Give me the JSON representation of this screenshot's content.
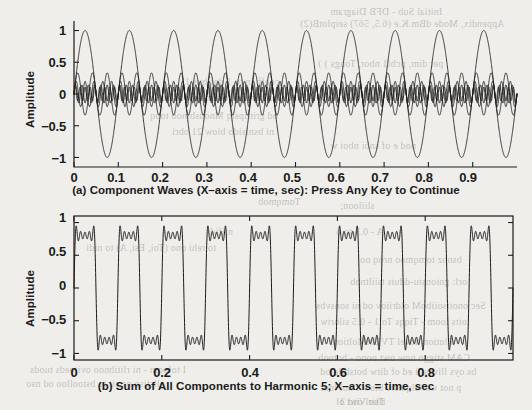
{
  "figure": {
    "background_color": "#efeeea",
    "line_color": "#1c1c1c",
    "panels": [
      {
        "id": "panel-a",
        "caption": "(a)  Component Waves (X–axis = time, sec): Press Any Key to Continue",
        "ylabel": "Amplitude",
        "yticks": [
          "1",
          "0.5",
          "0",
          "−0.5",
          "−1"
        ],
        "xticks": [
          "0",
          "0.1",
          "0.2",
          "0.3",
          "0.4",
          "0.5",
          "0.6",
          "0.7",
          "0.8",
          "0.9"
        ]
      },
      {
        "id": "panel-b",
        "caption": "(b)  Sum of All Components to Harmonic 5; X–axis = time, sec",
        "ylabel": "Amplitude",
        "yticks": [
          "1",
          "0.5",
          "0",
          "−0.5",
          "−1"
        ],
        "xticks": [
          "0",
          "0.2",
          "0.4",
          "0.6",
          "0.8"
        ]
      }
    ]
  },
  "chart_data": [
    {
      "type": "line",
      "id": "panel-a",
      "title": "(a)  Component Waves (X–axis = time, sec): Press Any Key to Continue",
      "xlabel": "time, sec",
      "ylabel": "Amplitude",
      "xlim": [
        0,
        1
      ],
      "ylim": [
        -1.15,
        1.15
      ],
      "xticks": [
        0,
        0.1,
        0.2,
        0.3,
        0.4,
        0.5,
        0.6,
        0.7,
        0.8,
        0.9
      ],
      "yticks": [
        -1,
        -0.5,
        0,
        0.5,
        1
      ],
      "grid": false,
      "legend": "none",
      "series": [
        {
          "name": "Harmonic 1 (fundamental)",
          "harmonic": 1,
          "amplitude": 1.0,
          "frequency_hz": 10,
          "waveform": "sine"
        },
        {
          "name": "Harmonic 3",
          "harmonic": 3,
          "amplitude": 0.3333,
          "frequency_hz": 30,
          "waveform": "sine"
        },
        {
          "name": "Harmonic 5",
          "harmonic": 5,
          "amplitude": 0.2,
          "frequency_hz": 50,
          "waveform": "sine"
        },
        {
          "name": "Harmonic 7",
          "harmonic": 7,
          "amplitude": 0.1429,
          "frequency_hz": 70,
          "waveform": "sine"
        },
        {
          "name": "Harmonic 9",
          "harmonic": 9,
          "amplitude": 0.1111,
          "frequency_hz": 90,
          "waveform": "sine"
        }
      ]
    },
    {
      "type": "line",
      "id": "panel-b",
      "title": "(b)  Sum of All Components to Harmonic 5; X–axis = time, sec",
      "xlabel": "time, sec",
      "ylabel": "Amplitude",
      "xlim": [
        0,
        1
      ],
      "ylim": [
        -1.1,
        1.1
      ],
      "xticks": [
        0,
        0.2,
        0.4,
        0.6,
        0.8
      ],
      "yticks": [
        -1,
        -0.5,
        0,
        0.5,
        1
      ],
      "grid": false,
      "legend": "none",
      "series": [
        {
          "name": "Sum of harmonics 1,3,5,7,9",
          "description": "Partial Fourier square-wave synthesis, 5 odd harmonics, fundamental 10 Hz",
          "peak_amplitude": 0.95,
          "harmonics": [
            1,
            3,
            5,
            7,
            9
          ],
          "amplitudes": [
            1.0,
            0.3333,
            0.2,
            0.1429,
            0.1111
          ]
        }
      ]
    }
  ],
  "bleed_text": [
    {
      "text": "Initial Sub - DFB Diagram",
      "x": 330,
      "y": 6
    },
    {
      "text": "Appendix, Mode dBm.K.e (6.5, 567)  seiplotB(2)",
      "x": 300,
      "y": 18
    },
    {
      "text": "per dim, pcbi1 nbor, Tongs ) )",
      "x": 318,
      "y": 58
    },
    {
      "text": "coeff an to 1 dof bus 11",
      "x": 180,
      "y": 76
    },
    {
      "text": "la conpon rodi: nobw ad of",
      "x": 162,
      "y": 92
    },
    {
      "text": "od grittipsiq Mnonsbinoo tooq",
      "x": 150,
      "y": 110
    },
    {
      "text": "ni bsnisido biow 21 obri",
      "x": 172,
      "y": 126
    },
    {
      "text": "nod e of snbi nboi w",
      "x": 330,
      "y": 140
    },
    {
      "text": "sliiloon;",
      "x": 340,
      "y": 200
    },
    {
      "text": "Tomqmob",
      "x": 258,
      "y": 196
    },
    {
      "text": "niifid",
      "x": 210,
      "y": 226
    },
    {
      "text": "to rehi ono (Toi, Esi, A) to nidi",
      "x": 86,
      "y": 242
    },
    {
      "text": "A - 0.5 to 6",
      "x": 336,
      "y": 226
    },
    {
      "text": "bsnoz tomqmoo nroq no",
      "x": 360,
      "y": 254
    },
    {
      "text": "orl: gnionsiu-dduis  tsiiltnob",
      "x": 350,
      "y": 276
    },
    {
      "text": "Sec onoitsoiiboM oldriiov od ni sonsvbs",
      "x": 316,
      "y": 300
    },
    {
      "text": "oits loom - Tiqqs To 1 - 0.5 siloriw",
      "x": 320,
      "y": 316
    },
    {
      "text": "Flution hovel  TVEbiMoltion,",
      "x": 330,
      "y": 336
    },
    {
      "text": "CAM stiggo now owt  oono - botoob",
      "x": 318,
      "y": 352
    },
    {
      "text": "bs oys lliw sili ed of ditw botsbilo od",
      "x": 320,
      "y": 366
    },
    {
      "text": "I tofoom - ni rlitibnoo ovitoeds tuods",
      "x": 30,
      "y": 364
    },
    {
      "text": "llstiso oz sit to bstoolloo od nso",
      "x": 26,
      "y": 378
    },
    {
      "text": "p not wei olqmslo  biow s nol lnor",
      "x": 320,
      "y": 382
    },
    {
      "text": "rlsirl owt ol",
      "x": 336,
      "y": 396
    },
    {
      "text": "Tho Vitd 3",
      "x": 340,
      "y": 396
    }
  ]
}
